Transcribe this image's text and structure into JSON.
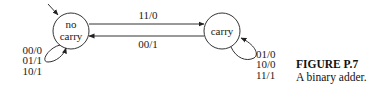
{
  "diagram": {
    "type": "state-machine",
    "states": [
      {
        "id": "no_carry",
        "label_line1": "no",
        "label_line2": "carry",
        "initial": true
      },
      {
        "id": "carry",
        "label": "carry",
        "initial": false
      }
    ],
    "transitions": [
      {
        "from": "no_carry",
        "to": "carry",
        "label": "11/0"
      },
      {
        "from": "carry",
        "to": "no_carry",
        "label": "00/1"
      },
      {
        "from": "no_carry",
        "to": "no_carry",
        "labels": [
          "00/0",
          "01/1",
          "10/1"
        ]
      },
      {
        "from": "carry",
        "to": "carry",
        "labels": [
          "01/0",
          "10/0",
          "11/1"
        ]
      }
    ]
  },
  "caption": {
    "title": "FIGURE P.7",
    "text": "A binary adder."
  }
}
